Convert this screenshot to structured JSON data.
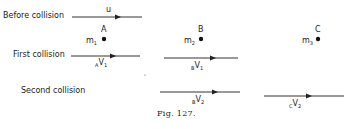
{
  "rows": {
    "before": "Before collision",
    "first": "First collision",
    "second": "Second collision"
  },
  "bodies": [
    {
      "letter": "A",
      "mass": "m",
      "mass_sub": "1"
    },
    {
      "letter": "B",
      "mass": "m",
      "mass_sub": "2"
    },
    {
      "letter": "C",
      "mass": "m",
      "mass_sub": "3"
    }
  ],
  "velocities": {
    "u": "u",
    "a_v1": {
      "pre": "A",
      "v": "V",
      "sub": "1"
    },
    "b_v1": {
      "pre": "B",
      "v": "V",
      "sub": "1"
    },
    "b_v2": {
      "pre": "B",
      "v": "V",
      "sub": "2"
    },
    "c_v2": {
      "pre": "C",
      "v": "V",
      "sub": "2"
    }
  },
  "caption": "Fig. 127."
}
